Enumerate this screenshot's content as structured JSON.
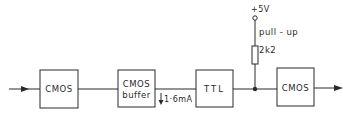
{
  "diagram": {
    "blocks": [
      {
        "id": "cmos1",
        "label": "CMOS"
      },
      {
        "id": "cmos_buffer",
        "label_line1": "CMOS",
        "label_line2": "buffer"
      },
      {
        "id": "ttl",
        "label": "TTL"
      },
      {
        "id": "cmos2",
        "label": "CMOS"
      }
    ],
    "current_annotation": "1·6mA",
    "supply_label": "+5V",
    "pullup_label": "pull - up",
    "resistor_value": "2k2",
    "colors": {
      "line": "#2a2a2a",
      "background": "#ffffff"
    }
  }
}
